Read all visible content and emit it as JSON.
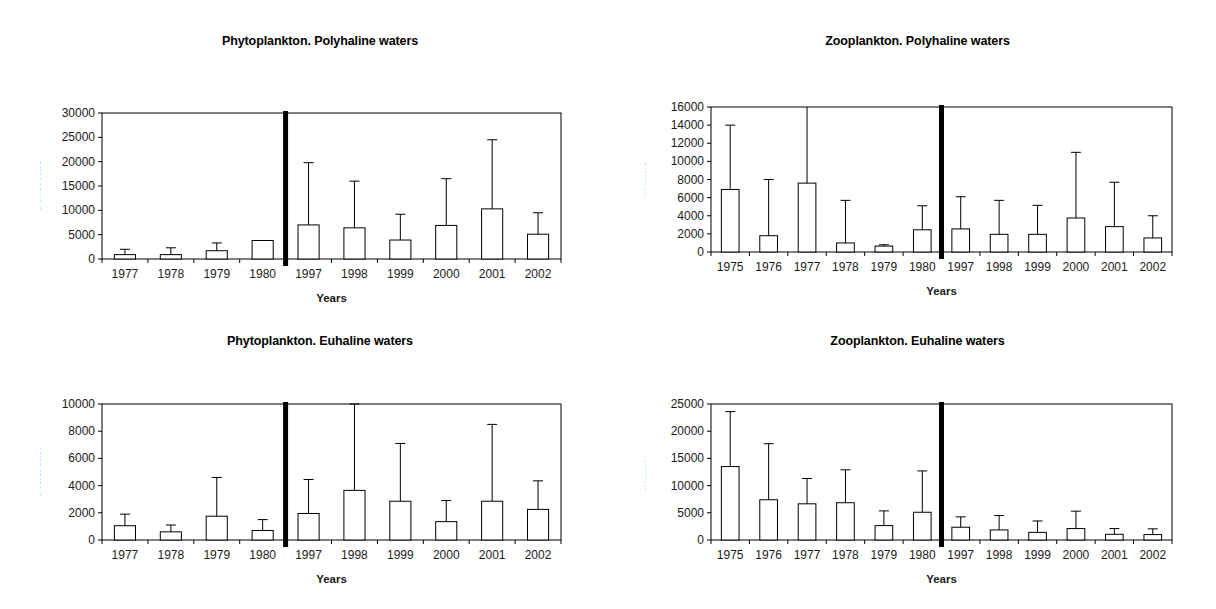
{
  "figure": {
    "background": "#ffffff",
    "width": 1216,
    "height": 609,
    "line_color": "#000000",
    "divider_color": "#000000",
    "bar_fill": "#ffffff"
  },
  "panels": [
    {
      "id": "phyto-poly",
      "title": "Phytoplankton. Polyhaline waters"
    },
    {
      "id": "zoo-poly",
      "title": "Zooplankton. Polyhaline waters"
    },
    {
      "id": "phyto-eu",
      "title": "Phytoplankton. Euhaline waters"
    },
    {
      "id": "zoo-eu",
      "title": "Zooplankton. Euhaline waters"
    }
  ],
  "chart_data": [
    {
      "id": "phyto-poly",
      "type": "bar",
      "title": "Phytoplankton. Polyhaline waters",
      "xlabel": "Years",
      "ylabel": "Cells/cm3",
      "ylim": [
        0,
        30000
      ],
      "yticks": [
        0,
        5000,
        10000,
        15000,
        20000,
        25000,
        30000
      ],
      "ytick_labels": [
        "0",
        "5000",
        "10000",
        "15000",
        "20000",
        "25000",
        "30000"
      ],
      "grid": false,
      "categories": [
        "1977",
        "1978",
        "1979",
        "1980",
        "1997",
        "1998",
        "1999",
        "2000",
        "2001",
        "2002"
      ],
      "values": [
        900,
        900,
        1700,
        3800,
        7000,
        6400,
        3900,
        6900,
        10300,
        5100
      ],
      "err_upper": [
        2000,
        2300,
        3300,
        null,
        19800,
        16000,
        9200,
        16500,
        24500,
        9500
      ],
      "divider_after_index": 3
    },
    {
      "id": "zoo-poly",
      "type": "bar",
      "title": "Zooplankton. Polyhaline waters",
      "xlabel": "Years",
      "ylabel": "Ind/m3",
      "ylim": [
        0,
        16000
      ],
      "yticks": [
        0,
        2000,
        4000,
        6000,
        8000,
        10000,
        12000,
        14000,
        16000
      ],
      "ytick_labels": [
        "0",
        "2000",
        "4000",
        "6000",
        "8000",
        "10000",
        "12000",
        "14000",
        "16000"
      ],
      "grid": false,
      "categories": [
        "1975",
        "1976",
        "1977",
        "1978",
        "1979",
        "1980",
        "1997",
        "1998",
        "1999",
        "2000",
        "2001",
        "2002"
      ],
      "values": [
        6900,
        1800,
        7600,
        1000,
        650,
        2450,
        2550,
        1950,
        1950,
        3750,
        2800,
        1550
      ],
      "err_upper": [
        14000,
        8000,
        16400,
        5700,
        800,
        5100,
        6100,
        5700,
        5150,
        11000,
        7700,
        4000
      ],
      "divider_after_index": 5
    },
    {
      "id": "phyto-eu",
      "type": "bar",
      "title": "Phytoplankton. Euhaline waters",
      "xlabel": "Years",
      "ylabel": "Cells/cm3",
      "ylim": [
        0,
        10000
      ],
      "yticks": [
        0,
        2000,
        4000,
        6000,
        8000,
        10000
      ],
      "ytick_labels": [
        "0",
        "2000",
        "4000",
        "6000",
        "8000",
        "10000"
      ],
      "grid": false,
      "categories": [
        "1977",
        "1978",
        "1979",
        "1980",
        "1997",
        "1998",
        "1999",
        "2000",
        "2001",
        "2002"
      ],
      "values": [
        1050,
        600,
        1750,
        700,
        1950,
        3650,
        2850,
        1350,
        2850,
        2250
      ],
      "err_upper": [
        1900,
        1100,
        4600,
        1500,
        4450,
        10000,
        7100,
        2900,
        8500,
        4350
      ],
      "divider_after_index": 3
    },
    {
      "id": "zoo-eu",
      "type": "bar",
      "title": "Zooplankton. Euhaline waters",
      "xlabel": "Years",
      "ylabel": "Ind/m3",
      "ylim": [
        0,
        25000
      ],
      "yticks": [
        0,
        5000,
        10000,
        15000,
        20000,
        25000
      ],
      "ytick_labels": [
        "0",
        "5000",
        "10000",
        "15000",
        "20000",
        "25000"
      ],
      "grid": false,
      "categories": [
        "1975",
        "1976",
        "1977",
        "1978",
        "1979",
        "1980",
        "1997",
        "1998",
        "1999",
        "2000",
        "2001",
        "2002"
      ],
      "values": [
        13500,
        7400,
        6650,
        6850,
        2650,
        5100,
        2350,
        1850,
        1400,
        2100,
        1050,
        1000
      ],
      "err_upper": [
        23600,
        17700,
        11300,
        12900,
        5350,
        12700,
        4250,
        4500,
        3500,
        5300,
        2100,
        2050
      ],
      "divider_after_index": 5
    }
  ]
}
